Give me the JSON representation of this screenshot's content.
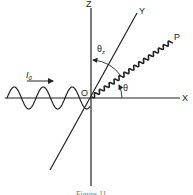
{
  "diagram": {
    "axes": {
      "x_label": "X",
      "y_label": "Y",
      "z_label": "Z",
      "origin_label": "O"
    },
    "incident_beam": {
      "label_main": "I",
      "label_sub": "0",
      "direction": "along +X toward origin"
    },
    "scattered_ray": {
      "endpoint_label": "P"
    },
    "angles": {
      "theta_label": "θ",
      "theta_z_label": "θ",
      "theta_z_sub": "z"
    },
    "caption": "Figure 11"
  },
  "colors": {
    "ink": "#222222",
    "background": "#ffffff"
  }
}
